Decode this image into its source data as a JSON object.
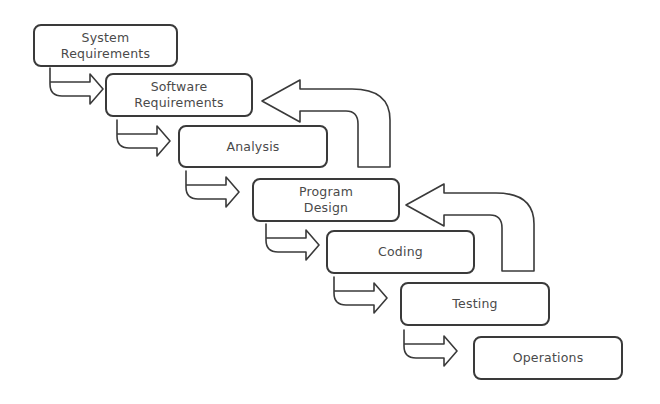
{
  "diagram": {
    "type": "waterfall-model",
    "stages": [
      {
        "id": "system-requirements",
        "label": "System\nRequirements"
      },
      {
        "id": "software-requirements",
        "label": "Software\nRequirements"
      },
      {
        "id": "analysis",
        "label": "Analysis"
      },
      {
        "id": "program-design",
        "label": "Program\nDesign"
      },
      {
        "id": "coding",
        "label": "Coding"
      },
      {
        "id": "testing",
        "label": "Testing"
      },
      {
        "id": "operations",
        "label": "Operations"
      }
    ],
    "forward_arrows": [
      {
        "from": "system-requirements",
        "to": "software-requirements"
      },
      {
        "from": "software-requirements",
        "to": "analysis"
      },
      {
        "from": "analysis",
        "to": "program-design"
      },
      {
        "from": "program-design",
        "to": "coding"
      },
      {
        "from": "coding",
        "to": "testing"
      },
      {
        "from": "testing",
        "to": "operations"
      }
    ],
    "feedback_arrows": [
      {
        "from": "analysis",
        "to": "software-requirements"
      },
      {
        "from": "coding",
        "to": "program-design"
      }
    ],
    "colors": {
      "stroke": "#3a3a3a",
      "text": "#4a4a4a",
      "background": "#ffffff"
    }
  }
}
